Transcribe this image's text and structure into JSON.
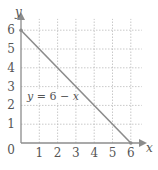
{
  "chart_data": {
    "type": "line",
    "title": "",
    "xlabel": "x",
    "ylabel": "y",
    "xlim": [
      0,
      6
    ],
    "ylim": [
      0,
      6
    ],
    "grid": true,
    "x_ticks": [
      "1",
      "2",
      "3",
      "4",
      "5",
      "6"
    ],
    "y_ticks": [
      "1",
      "2",
      "3",
      "4",
      "5",
      "6"
    ],
    "origin_label": "0",
    "series": [
      {
        "name": "y = 6 − x",
        "x": [
          0,
          6
        ],
        "y": [
          6,
          0
        ]
      }
    ],
    "annotations": [
      {
        "text": "y = 6 − x",
        "x": 0.3,
        "y": 2.3
      }
    ],
    "colors": {
      "line": "#8c8c8c",
      "axis": "#8c8c8c",
      "grid": "#bbbbbb",
      "text": "#555555"
    }
  }
}
